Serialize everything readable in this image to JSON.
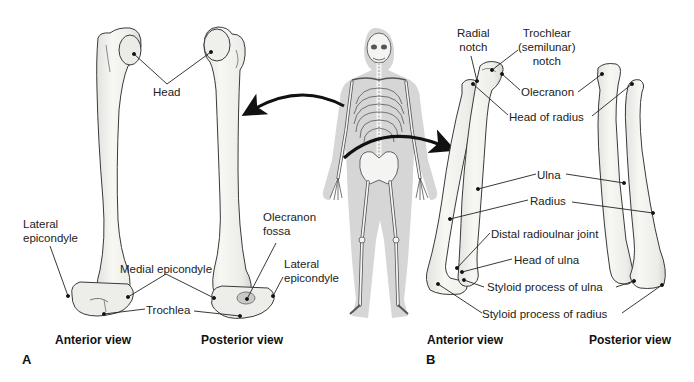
{
  "figure": {
    "panel_a": {
      "letter": "A",
      "bone": "Humerus",
      "views": {
        "anterior": "Anterior view",
        "posterior": "Posterior view"
      },
      "labels": {
        "head": "Head",
        "lateral_epicondyle_anterior": [
          "Lateral",
          "epicondyle"
        ],
        "medial_epicondyle": "Medial epicondyle",
        "trochlea": "Trochlea",
        "olecranon_fossa": [
          "Olecranon",
          "fossa"
        ],
        "lateral_epicondyle_posterior": [
          "Lateral",
          "epicondyle"
        ]
      }
    },
    "center": {
      "description": "Full human skeleton silhouette",
      "arrows": [
        "arrow-to-humerus",
        "arrow-to-forearm"
      ]
    },
    "panel_b": {
      "letter": "B",
      "bones": [
        "Ulna",
        "Radius"
      ],
      "views": {
        "anterior": "Anterior view",
        "posterior": "Posterior view"
      },
      "labels": {
        "radial_notch": [
          "Radial",
          "notch"
        ],
        "trochlear_notch": [
          "Trochlear",
          "(semilunar)",
          "notch"
        ],
        "olecranon": "Olecranon",
        "head_of_radius": "Head of radius",
        "ulna": "Ulna",
        "radius": "Radius",
        "distal_radioulnar_joint": "Distal radioulnar joint",
        "head_of_ulna": "Head of ulna",
        "styloid_process_ulna": "Styloid process of ulna",
        "styloid_process_radius": "Styloid process of radius"
      }
    },
    "colors": {
      "bone_fill": "#f1f1ee",
      "bone_shade": "#d8d8d4",
      "outline": "#3a3a3a",
      "leader": "#222222",
      "skeleton_halo": "#d6d6d6",
      "arrow": "#111111"
    }
  }
}
